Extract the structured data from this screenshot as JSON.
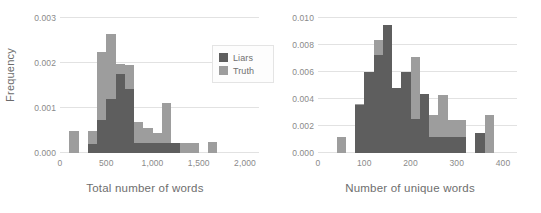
{
  "figure": {
    "background": "#ffffff",
    "panel_count": 2
  },
  "legend": {
    "position": "upper-right-of-left-panel",
    "entries": [
      {
        "label": "Liars",
        "color": "#5e5e5e"
      },
      {
        "label": "Truth",
        "color": "#9d9d9d"
      }
    ]
  },
  "chart_data": [
    {
      "type": "bar",
      "subtype": "histogram",
      "panel": "left",
      "title": "",
      "xlabel": "Total number of words",
      "ylabel": "Frequency",
      "xlim": [
        0,
        2000
      ],
      "ylim": [
        0,
        0.003
      ],
      "xticks": [
        0,
        500,
        1000,
        1500,
        2000
      ],
      "xtick_labels": [
        "0",
        "500",
        "1,000",
        "1,500",
        "2,000"
      ],
      "yticks": [
        0.0,
        0.001,
        0.002,
        0.003
      ],
      "ytick_labels": [
        "0.000",
        "0.001",
        "0.002",
        "0.003"
      ],
      "grid": "horizontal",
      "bin_width": 100,
      "bin_starts": [
        100,
        200,
        300,
        400,
        500,
        600,
        700,
        800,
        900,
        1000,
        1100,
        1200,
        1300,
        1400,
        1500,
        1600
      ],
      "series": [
        {
          "name": "Truth",
          "color": "#9d9d9d",
          "values": [
            0.00048,
            0.0,
            0.00048,
            0.00225,
            0.00265,
            0.00197,
            0.00195,
            0.0007,
            0.00055,
            0.00045,
            0.00112,
            0.00022,
            0.00022,
            0.00022,
            0.0,
            0.00025
          ]
        },
        {
          "name": "Liars",
          "color": "#5e5e5e",
          "values": [
            0.0,
            0.0,
            0.0002,
            0.00073,
            0.0012,
            0.00175,
            0.00143,
            0.00022,
            0.00022,
            0.00022,
            0.00022,
            0.00022,
            0.0,
            0.0,
            0.0,
            0.0
          ]
        }
      ]
    },
    {
      "type": "bar",
      "subtype": "histogram",
      "panel": "right",
      "title": "",
      "xlabel": "Number of unique words",
      "ylabel": "",
      "xlim": [
        0,
        400
      ],
      "ylim": [
        0,
        0.01
      ],
      "xticks": [
        0,
        100,
        200,
        300,
        400
      ],
      "xtick_labels": [
        "0",
        "100",
        "200",
        "300",
        "400"
      ],
      "yticks": [
        0.0,
        0.002,
        0.004,
        0.006,
        0.008,
        0.01
      ],
      "ytick_labels": [
        "0.000",
        "0.002",
        "0.004",
        "0.006",
        "0.008",
        "0.010"
      ],
      "grid": "horizontal",
      "bin_width": 20,
      "bin_starts": [
        40,
        60,
        80,
        100,
        120,
        140,
        160,
        180,
        200,
        220,
        240,
        260,
        280,
        300,
        320,
        340,
        360
      ],
      "series": [
        {
          "name": "Truth",
          "color": "#9d9d9d",
          "values": [
            0.00122,
            0.0,
            0.0036,
            0.006,
            0.0084,
            0.00845,
            0.0048,
            0.006,
            0.0071,
            0.00435,
            0.00285,
            0.0043,
            0.00245,
            0.00245,
            0.0,
            0.0015,
            0.00285
          ]
        },
        {
          "name": "Liars",
          "color": "#5e5e5e",
          "values": [
            0.0,
            0.0,
            0.00355,
            0.006,
            0.00725,
            0.0095,
            0.0048,
            0.006,
            0.0025,
            0.00435,
            0.0012,
            0.0012,
            0.0012,
            0.0012,
            0.0,
            0.0015,
            0.0
          ]
        }
      ]
    }
  ]
}
